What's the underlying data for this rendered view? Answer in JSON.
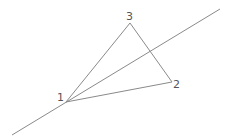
{
  "diagram": {
    "type": "geometry",
    "line_color": "#8a8a8a",
    "label_color": "#555555",
    "vertices": [
      {
        "id": "1",
        "label": "1",
        "x": 66,
        "y": 102,
        "label_x": 57,
        "label_y": 101
      },
      {
        "id": "2",
        "label": "2",
        "x": 172,
        "y": 82,
        "label_x": 173,
        "label_y": 88
      },
      {
        "id": "3",
        "label": "3",
        "x": 130,
        "y": 23,
        "label_x": 126,
        "label_y": 20
      }
    ],
    "edges": [
      {
        "from": "1",
        "to": "3"
      },
      {
        "from": "3",
        "to": "2"
      },
      {
        "from": "2",
        "to": "1"
      }
    ],
    "line": {
      "x1": 12,
      "y1": 135,
      "x2": 220,
      "y2": 9,
      "passes_through": "1"
    }
  }
}
